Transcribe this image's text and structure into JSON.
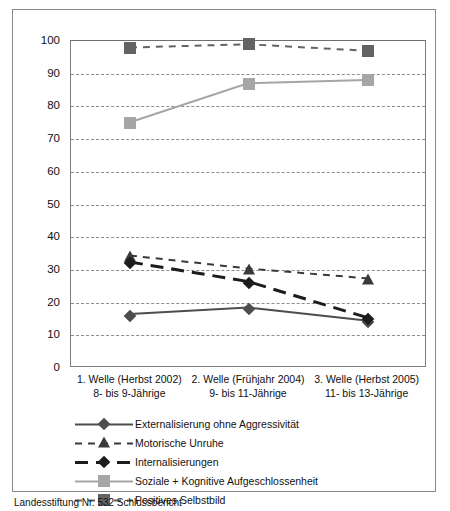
{
  "chart_data": {
    "type": "line",
    "title": "",
    "xlabel": "",
    "ylabel": "",
    "ylim": [
      0,
      100
    ],
    "ytick_step": 10,
    "grid": "horizontal-dashed",
    "legend_position": "below",
    "categories": [
      "1. Welle (Herbst 2002)",
      "2. Welle (Frühjahr 2004)",
      "3. Welle (Herbst 2005)"
    ],
    "category_sublabels": [
      "8- bis 9-Jährige",
      "9- bis 11-Jährige",
      "11- bis 13-Jährige"
    ],
    "yticks": [
      "0",
      "10",
      "20",
      "30",
      "40",
      "50",
      "60",
      "70",
      "80",
      "90",
      "100"
    ],
    "series": [
      {
        "name": "Externalisierung ohne Aggressivität",
        "values": [
          16,
          18,
          14
        ],
        "color": "#4d4d4d",
        "marker": "diamond",
        "linestyle": "solid",
        "linewidth": 2
      },
      {
        "name": "Motorische Unruhe",
        "values": [
          34,
          30,
          27
        ],
        "color": "#3a3a3a",
        "marker": "triangle",
        "linestyle": "dashed-short",
        "linewidth": 2
      },
      {
        "name": "Internalisierungen",
        "values": [
          32,
          26,
          15
        ],
        "color": "#1c1c1c",
        "marker": "diamond",
        "linestyle": "dashed-long",
        "linewidth": 3
      },
      {
        "name": "Soziale + Kognitive Aufgeschlossenheit",
        "values": [
          75,
          87,
          88
        ],
        "color": "#a6a6a6",
        "marker": "square",
        "linestyle": "solid",
        "linewidth": 2
      },
      {
        "name": "Positives Selbstbild",
        "values": [
          98,
          99,
          97
        ],
        "color": "#636363",
        "marker": "square",
        "linestyle": "dashed-short",
        "linewidth": 2
      }
    ]
  },
  "bottom_caption": "Landesstiftung Nr. 532 Schlussbericht"
}
